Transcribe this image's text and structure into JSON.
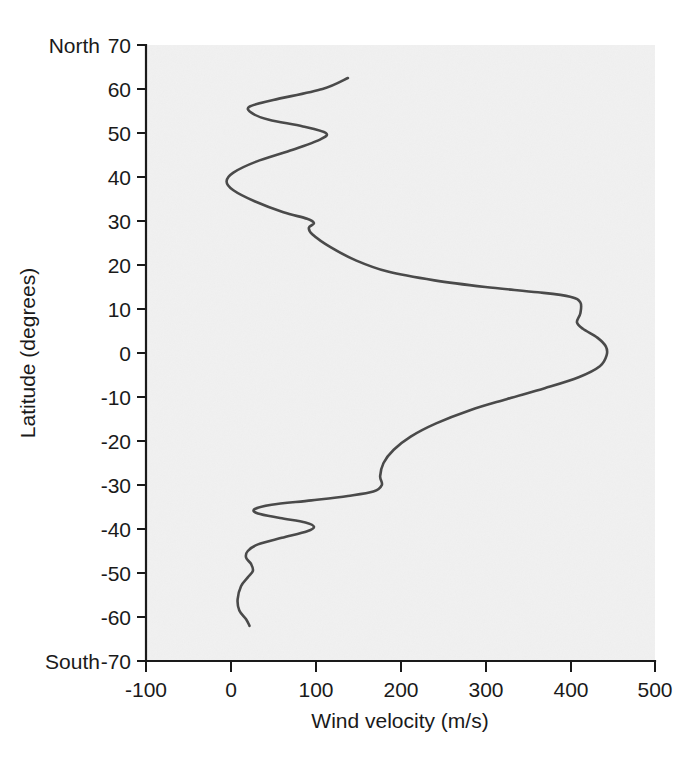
{
  "chart_data": {
    "type": "line",
    "title": "",
    "subtitle": "",
    "xlabel": "Wind velocity (m/s)",
    "ylabel": "Latitude (degrees)",
    "xlim": [
      -100,
      500
    ],
    "ylim": [
      -70,
      70
    ],
    "grid": false,
    "legend": null,
    "x_ticks": [
      -100,
      0,
      100,
      200,
      300,
      400,
      500
    ],
    "x_tick_labels": [
      "-100",
      "0",
      "100",
      "200",
      "300",
      "400",
      "500"
    ],
    "y_ticks": [
      70,
      60,
      50,
      40,
      30,
      20,
      10,
      0,
      -10,
      -20,
      -30,
      -40,
      -50,
      -60,
      -70
    ],
    "y_tick_labels": [
      "70",
      "60",
      "50",
      "40",
      "30",
      "20",
      "10",
      "0",
      "-10",
      "-20",
      "-30",
      "-40",
      "-50",
      "-60",
      "-70"
    ],
    "axis_end_labels": {
      "y_top": "North",
      "y_bottom": "South"
    },
    "series": [
      {
        "name": "Zonal wind velocity",
        "orientation": "vertical",
        "x_is_value": true,
        "points": [
          {
            "latitude": 62.5,
            "velocity": 138
          },
          {
            "latitude": 60.0,
            "velocity": 108
          },
          {
            "latitude": 57.5,
            "velocity": 50
          },
          {
            "latitude": 56.0,
            "velocity": 22
          },
          {
            "latitude": 54.5,
            "velocity": 25
          },
          {
            "latitude": 53.0,
            "velocity": 45
          },
          {
            "latitude": 51.5,
            "velocity": 85
          },
          {
            "latitude": 50.0,
            "velocity": 112
          },
          {
            "latitude": 48.5,
            "velocity": 105
          },
          {
            "latitude": 46.0,
            "velocity": 70
          },
          {
            "latitude": 43.5,
            "velocity": 30
          },
          {
            "latitude": 41.0,
            "velocity": 3
          },
          {
            "latitude": 39.0,
            "velocity": -5
          },
          {
            "latitude": 37.0,
            "velocity": 3
          },
          {
            "latitude": 34.5,
            "velocity": 28
          },
          {
            "latitude": 32.0,
            "velocity": 62
          },
          {
            "latitude": 30.5,
            "velocity": 90
          },
          {
            "latitude": 29.5,
            "velocity": 98
          },
          {
            "latitude": 28.5,
            "velocity": 92
          },
          {
            "latitude": 27.0,
            "velocity": 96
          },
          {
            "latitude": 24.0,
            "velocity": 118
          },
          {
            "latitude": 21.0,
            "velocity": 148
          },
          {
            "latitude": 18.5,
            "velocity": 185
          },
          {
            "latitude": 16.5,
            "velocity": 240
          },
          {
            "latitude": 15.0,
            "velocity": 300
          },
          {
            "latitude": 13.8,
            "velocity": 362
          },
          {
            "latitude": 12.8,
            "velocity": 400
          },
          {
            "latitude": 11.5,
            "velocity": 412
          },
          {
            "latitude": 9.0,
            "velocity": 412
          },
          {
            "latitude": 7.0,
            "velocity": 408
          },
          {
            "latitude": 5.5,
            "velocity": 415
          },
          {
            "latitude": 3.5,
            "velocity": 432
          },
          {
            "latitude": 1.5,
            "velocity": 442
          },
          {
            "latitude": -0.5,
            "velocity": 443
          },
          {
            "latitude": -3.0,
            "velocity": 435
          },
          {
            "latitude": -5.5,
            "velocity": 410
          },
          {
            "latitude": -8.0,
            "velocity": 370
          },
          {
            "latitude": -10.5,
            "velocity": 325
          },
          {
            "latitude": -13.0,
            "velocity": 282
          },
          {
            "latitude": -16.0,
            "velocity": 242
          },
          {
            "latitude": -19.0,
            "velocity": 212
          },
          {
            "latitude": -22.0,
            "velocity": 192
          },
          {
            "latitude": -25.0,
            "velocity": 180
          },
          {
            "latitude": -28.0,
            "velocity": 176
          },
          {
            "latitude": -30.0,
            "velocity": 178
          },
          {
            "latitude": -31.5,
            "velocity": 168
          },
          {
            "latitude": -32.5,
            "velocity": 138
          },
          {
            "latitude": -33.5,
            "velocity": 95
          },
          {
            "latitude": -34.5,
            "velocity": 48
          },
          {
            "latitude": -35.5,
            "velocity": 28
          },
          {
            "latitude": -36.5,
            "velocity": 32
          },
          {
            "latitude": -37.5,
            "velocity": 58
          },
          {
            "latitude": -38.5,
            "velocity": 88
          },
          {
            "latitude": -39.5,
            "velocity": 98
          },
          {
            "latitude": -40.5,
            "velocity": 90
          },
          {
            "latitude": -42.0,
            "velocity": 60
          },
          {
            "latitude": -43.5,
            "velocity": 32
          },
          {
            "latitude": -45.0,
            "velocity": 20
          },
          {
            "latitude": -46.5,
            "velocity": 18
          },
          {
            "latitude": -48.0,
            "velocity": 24
          },
          {
            "latitude": -49.5,
            "velocity": 26
          },
          {
            "latitude": -51.0,
            "velocity": 20
          },
          {
            "latitude": -53.0,
            "velocity": 12
          },
          {
            "latitude": -56.0,
            "velocity": 8
          },
          {
            "latitude": -58.5,
            "velocity": 10
          },
          {
            "latitude": -60.5,
            "velocity": 18
          },
          {
            "latitude": -62.0,
            "velocity": 22
          }
        ]
      }
    ]
  },
  "colors": {
    "curve": "#4a4a4a",
    "axis": "#1a1a1a",
    "plot_background": "#f1f1f1",
    "page_background": "#ffffff"
  }
}
